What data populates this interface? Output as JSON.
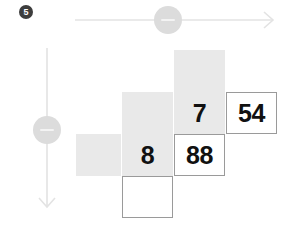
{
  "step": {
    "badge_label": "5"
  },
  "axes": {
    "horizontal": {
      "name": "horizontal-axis",
      "handle_label": "-"
    },
    "vertical": {
      "name": "vertical-axis",
      "handle_label": "-"
    }
  },
  "colors": {
    "cell_fill": "#e9e9e9",
    "cell_border": "#9a9a9a",
    "axis_line": "#e0e0e0",
    "handle_fill": "#dcdcdc",
    "badge_fill": "#3d3d3d",
    "text": "#111111"
  },
  "grid": {
    "cells": [
      {
        "id": "cell-r1c3",
        "row": 1,
        "col": 3,
        "style": "filled",
        "value": "",
        "x": 174,
        "y": 50,
        "w": 51,
        "h": 42
      },
      {
        "id": "cell-r2c2",
        "row": 2,
        "col": 2,
        "style": "filled",
        "value": "",
        "x": 122,
        "y": 92,
        "w": 51,
        "h": 42
      },
      {
        "id": "cell-r2c3",
        "row": 2,
        "col": 3,
        "style": "filled",
        "value": "7",
        "x": 174,
        "y": 92,
        "w": 51,
        "h": 42
      },
      {
        "id": "cell-r2c4",
        "row": 2,
        "col": 4,
        "style": "outlined",
        "value": "54",
        "x": 226,
        "y": 92,
        "w": 51,
        "h": 42
      },
      {
        "id": "cell-r3c1",
        "row": 3,
        "col": 1,
        "style": "filled",
        "value": "",
        "x": 76,
        "y": 134,
        "w": 45,
        "h": 42
      },
      {
        "id": "cell-r3c2",
        "row": 3,
        "col": 2,
        "style": "filled",
        "value": "8",
        "x": 122,
        "y": 134,
        "w": 51,
        "h": 42
      },
      {
        "id": "cell-r3c3",
        "row": 3,
        "col": 3,
        "style": "outlined",
        "value": "88",
        "x": 174,
        "y": 134,
        "w": 51,
        "h": 42
      },
      {
        "id": "cell-r4c2",
        "row": 4,
        "col": 2,
        "style": "outlined",
        "value": "",
        "x": 122,
        "y": 176,
        "w": 51,
        "h": 42
      }
    ]
  }
}
